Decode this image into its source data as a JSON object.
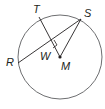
{
  "diagram": {
    "type": "circle-geometry",
    "circle": {
      "center_label": "M",
      "cx": 60,
      "cy": 57,
      "r": 42
    },
    "points": {
      "R": {
        "label": "R",
        "x": 18,
        "y": 63
      },
      "S": {
        "label": "S",
        "x": 81,
        "y": 19
      },
      "T": {
        "label": "T",
        "x": 39,
        "y": 17
      },
      "W": {
        "label": "W",
        "x": 51,
        "y": 42
      },
      "M": {
        "label": "M",
        "x": 60,
        "y": 57
      }
    },
    "segments": [
      "RS",
      "TM",
      "SM"
    ],
    "right_angle_at": "W",
    "colors": {
      "stroke": "#231f20",
      "circle": "#6d6e70",
      "background": "#ffffff"
    }
  }
}
